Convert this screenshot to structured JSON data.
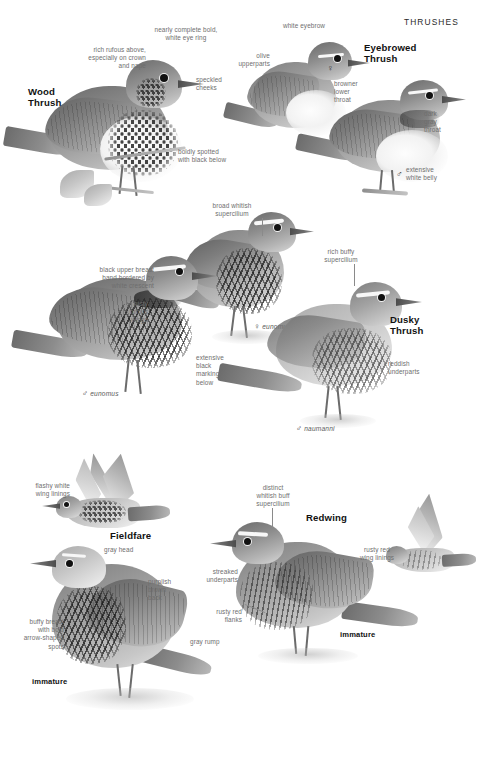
{
  "page": {
    "header": "THRUSHES",
    "family": "Thrushes",
    "width": 480,
    "height": 762,
    "background": "#ffffff",
    "text_color": "#6e6e6e",
    "heading_color": "#111111"
  },
  "species": [
    {
      "id": "wood-thrush",
      "name": "Wood Thrush",
      "name_line1": "Wood",
      "name_line2": "Thrush",
      "annotations": [
        {
          "id": "wt-eyering",
          "text": "nearly complete bold,\nwhite eye ring"
        },
        {
          "id": "wt-rufous",
          "text": "rich rufous above,\nespecially on crown\nand nape"
        },
        {
          "id": "wt-cheeks",
          "text": "speckled\ncheeks"
        },
        {
          "id": "wt-spotted",
          "text": "boldly spotted\nwith black below"
        }
      ]
    },
    {
      "id": "eyebrowed-thrush",
      "name": "Eyebrowed Thrush",
      "name_line1": "Eyebrowed",
      "name_line2": "Thrush",
      "annotations": [
        {
          "id": "et-eyebrow",
          "text": "white eyebrow"
        },
        {
          "id": "et-olive",
          "text": "olive\nupperparts"
        },
        {
          "id": "et-throat",
          "text": "browner\nlower\nthroat"
        },
        {
          "id": "et-darkgray",
          "text": "dark\ngray\nthroat"
        },
        {
          "id": "et-belly",
          "text": "extensive\nwhite belly"
        }
      ],
      "sex_marks": [
        {
          "id": "et-female",
          "symbol": "♀",
          "label": ""
        },
        {
          "id": "et-male",
          "symbol": "♂",
          "label": ""
        }
      ]
    },
    {
      "id": "dusky-thrush",
      "name": "Dusky Thrush",
      "name_line1": "Dusky",
      "name_line2": "Thrush",
      "annotations": [
        {
          "id": "dt-supercilium",
          "text": "broad whitish\nsupercilium"
        },
        {
          "id": "dt-breastband",
          "text": "black upper breast\nband bordered by\nwhite crescent"
        },
        {
          "id": "dt-wings",
          "text": "rusty\nrufous\nwings"
        },
        {
          "id": "dt-markings",
          "text": "extensive\nblack\nmarkings\nbelow"
        },
        {
          "id": "dt-buffy",
          "text": "rich buffy\nsupercilium"
        },
        {
          "id": "dt-reddish",
          "text": "reddish\nunderparts"
        }
      ],
      "sex_marks": [
        {
          "id": "dt-female-eunomus",
          "symbol": "♀",
          "label": "eunomus"
        },
        {
          "id": "dt-male-eunomus",
          "symbol": "♂",
          "label": "eunomus"
        },
        {
          "id": "dt-male-naumanni",
          "symbol": "♂",
          "label": "naumanni"
        }
      ]
    },
    {
      "id": "fieldfare",
      "name": "Fieldfare",
      "name_line1": "Fieldfare",
      "name_line2": "",
      "annotations": [
        {
          "id": "ff-winglinings",
          "text": "flashy white\nwing linings"
        },
        {
          "id": "ff-grayhead",
          "text": "gray head"
        },
        {
          "id": "ff-back",
          "text": "purplish\nbrown\nback"
        },
        {
          "id": "ff-breast",
          "text": "buffy breast\nwith bold\narrow-shaped\nspots"
        },
        {
          "id": "ff-rump",
          "text": "gray rump"
        }
      ],
      "age_marks": [
        {
          "id": "ff-immature",
          "label": "immature"
        }
      ]
    },
    {
      "id": "redwing",
      "name": "Redwing",
      "name_line1": "Redwing",
      "name_line2": "",
      "annotations": [
        {
          "id": "rw-supercilium",
          "text": "distinct\nwhitish buff\nsupercilium"
        },
        {
          "id": "rw-winglinings",
          "text": "rusty red\nwing linings"
        },
        {
          "id": "rw-streaked",
          "text": "streaked\nunderparts"
        },
        {
          "id": "rw-flanks",
          "text": "rusty red\nflanks"
        }
      ],
      "age_marks": [
        {
          "id": "rw-immature",
          "label": "immature"
        }
      ]
    }
  ]
}
